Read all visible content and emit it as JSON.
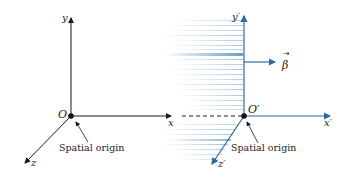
{
  "diagram": {
    "colors": {
      "stationary_frame": "#1a1a1a",
      "moving_frame": "#2e6a9e",
      "speed_lines": "#4a86b8"
    },
    "stationary_frame": {
      "origin_label": "O",
      "x_label": "x",
      "y_label": "y",
      "z_label": "z",
      "origin_caption": "Spatial origin"
    },
    "moving_frame": {
      "origin_label": "O′",
      "x_label": "x′",
      "y_label": "y′",
      "z_label": "z′",
      "origin_caption": "Spatial origin",
      "velocity_label": "β"
    }
  }
}
